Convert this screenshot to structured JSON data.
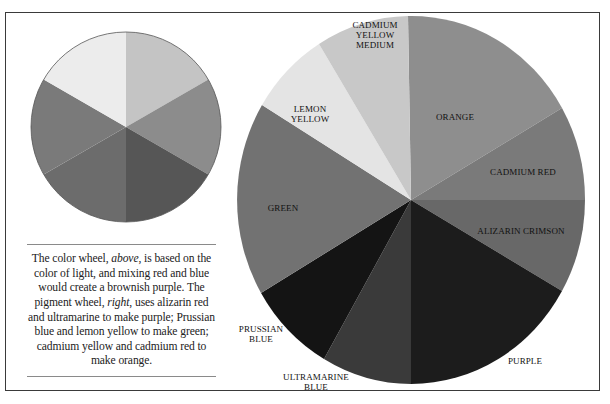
{
  "caption": {
    "part1": "The color wheel, ",
    "above": "above",
    "part2": ", is based on the color of light, and mixing red and blue would create a brownish purple. The pigment wheel, ",
    "right": "right",
    "part3": ", uses alizarin red and ultramarine to make purple; Prussian blue and lemon yellow to make green; cadmium yellow and cadmium red to make orange."
  },
  "light_wheel": {
    "segments": [
      {
        "name": "segment-1",
        "color": "#c4c4c4"
      },
      {
        "name": "segment-2",
        "color": "#8c8c8c"
      },
      {
        "name": "segment-3",
        "color": "#565656"
      },
      {
        "name": "segment-4",
        "color": "#6c6c6c"
      },
      {
        "name": "segment-5",
        "color": "#7a7a7a"
      },
      {
        "name": "segment-6",
        "color": "#ececec"
      }
    ]
  },
  "pigment_wheel": {
    "labels": {
      "cadmium_yellow_medium": [
        "CADMIUM",
        "YELLOW",
        "MEDIUM"
      ],
      "lemon_yellow": [
        "LEMON",
        "YELLOW"
      ],
      "orange": "ORANGE",
      "cadmium_red": "CADMIUM RED",
      "alizarin_crimson": "ALIZARIN CRIMSON",
      "green": "GREEN",
      "prussian_blue": [
        "PRUSSIAN",
        "BLUE"
      ],
      "ultramarine_blue": [
        "ULTRAMARINE",
        "BLUE"
      ],
      "purple": "PURPLE"
    },
    "colors": {
      "orange": "#8e8e8e",
      "cadmium_red": "#7a7a7a",
      "alizarin_crimson": "#6a6a6a",
      "purple": "#1c1c1c",
      "ultramarine_blue": "#3a3a3a",
      "prussian_blue": "#141414",
      "green": "#727272",
      "lemon_yellow": "#e4e4e4",
      "cadmium_yellow_medium": "#c8c8c8"
    }
  }
}
